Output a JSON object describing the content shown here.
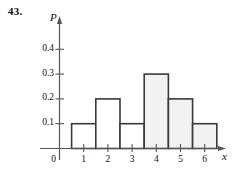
{
  "exercise": {
    "number_label": "43."
  },
  "chart_data": {
    "type": "bar",
    "title": "",
    "subtitle": "",
    "xlabel": "x",
    "ylabel": "P",
    "categories": [
      "1",
      "2",
      "3",
      "4",
      "5",
      "6"
    ],
    "values": [
      0.1,
      0.2,
      0.1,
      0.3,
      0.2,
      0.1
    ],
    "bar_fills": [
      "#ffffff",
      "#ffffff",
      "#ffffff",
      "#f2f2f2",
      "#f2f2f2",
      "#f2f2f2"
    ],
    "bar_shaded": [
      false,
      false,
      false,
      true,
      true,
      true
    ],
    "bar_edge_color": "#3a3a3a",
    "bar_half_width": 0.5,
    "xlim": [
      0,
      6.9
    ],
    "ylim": [
      0,
      0.47
    ],
    "grid": false,
    "legend": null,
    "x_tick_labels": [
      "0",
      "1",
      "2",
      "3",
      "4",
      "5",
      "6"
    ],
    "x_tick_values": [
      0,
      1,
      2,
      3,
      4,
      5,
      6
    ],
    "y_tick_labels": [
      "0.1",
      "0.2",
      "0.3",
      "0.4"
    ],
    "y_tick_values": [
      0.1,
      0.2,
      0.3,
      0.4
    ],
    "origin_label": "0",
    "axis_arrows": true,
    "axis_color": "#555555"
  },
  "colors": {
    "axis": "#555555",
    "bar_edge": "#3a3a3a",
    "bar_shaded_fill": "#f2f2f2",
    "bar_plain_fill": "#ffffff",
    "text": "#111111",
    "background": "#ffffff"
  }
}
